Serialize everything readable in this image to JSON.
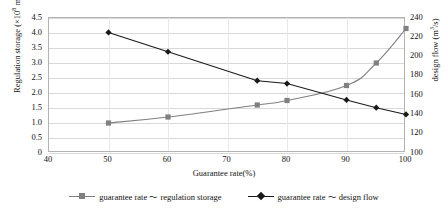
{
  "chart_data": {
    "type": "line",
    "title": "",
    "xlabel": "Guarantee rate(%)",
    "ylabel_left": "Regulation storage (×108 m3)",
    "ylabel_right": "design flow (m3/s)",
    "xlim": [
      40,
      100
    ],
    "ylim_left": [
      0,
      4.5
    ],
    "ylim_right": [
      100,
      240
    ],
    "xticks": [
      "40",
      "50",
      "60",
      "70",
      "80",
      "90",
      "100"
    ],
    "yticks_left": [
      "0",
      "0.5",
      "1.0",
      "1.5",
      "2.0",
      "2.5",
      "3.0",
      "3.5",
      "4.0",
      "4.5"
    ],
    "yticks_right": [
      "100",
      "120",
      "140",
      "160",
      "180",
      "200",
      "220",
      "240"
    ],
    "grid": true,
    "legend_position": "bottom",
    "series": [
      {
        "name": "guarantee rate ~ regulation storage",
        "axis": "left",
        "marker": "square",
        "color": "#808080",
        "x": [
          50,
          60,
          75,
          80,
          90,
          95,
          100
        ],
        "values": [
          1.0,
          1.2,
          1.6,
          1.75,
          2.25,
          3.0,
          4.15
        ]
      },
      {
        "name": "guarantee rate ~ design flow",
        "axis": "right",
        "marker": "diamond",
        "color": "#1a1a1a",
        "x": [
          50,
          60,
          75,
          80,
          90,
          95,
          100
        ],
        "values": [
          225,
          205,
          175,
          172,
          155,
          147,
          140
        ]
      }
    ]
  },
  "axes": {
    "x_title": "Guarantee rate(%)",
    "y_left_title_pre": "Regulation storage (×10",
    "y_left_title_exp": "8",
    "y_left_title_mid": " m",
    "y_left_title_exp2": "3",
    "y_left_title_post": ")",
    "y_right_title_pre": "design flow (m",
    "y_right_title_exp": "3",
    "y_right_title_post": "/s)"
  },
  "legend": {
    "items": [
      {
        "label": "guarantee rate ～ regulation storage",
        "marker": "square-marker",
        "color": "#808080"
      },
      {
        "label": "guarantee rate ～ design flow",
        "marker": "diamond-marker",
        "color": "#1a1a1a"
      }
    ]
  },
  "artifact": {
    "top_clipped_text": ""
  }
}
